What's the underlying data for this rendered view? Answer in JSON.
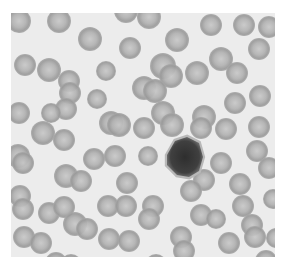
{
  "image": {
    "caption": "Blood smear micrograph with red blood cells and a central lymphocyte",
    "background_color": "#ececec",
    "cell_color": "#9e9e9e",
    "cell_center_color": "#c4c4c4",
    "lymphocyte_color": "#3a3a3a"
  },
  "cells": [
    [
      8,
      8,
      12
    ],
    [
      48,
      8,
      12
    ],
    [
      115,
      -2,
      12
    ],
    [
      138,
      4,
      12
    ],
    [
      200,
      12,
      11
    ],
    [
      233,
      12,
      11
    ],
    [
      258,
      14,
      11
    ],
    [
      79,
      26,
      12
    ],
    [
      119,
      35,
      11
    ],
    [
      166,
      27,
      12
    ],
    [
      210,
      46,
      12
    ],
    [
      248,
      36,
      11
    ],
    [
      14,
      52,
      11
    ],
    [
      38,
      57,
      12
    ],
    [
      58,
      68,
      11
    ],
    [
      95,
      58,
      10
    ],
    [
      152,
      53,
      13
    ],
    [
      160,
      63,
      12
    ],
    [
      186,
      60,
      12
    ],
    [
      226,
      60,
      11
    ],
    [
      59,
      80,
      11
    ],
    [
      55,
      96,
      11
    ],
    [
      40,
      100,
      10
    ],
    [
      86,
      86,
      10
    ],
    [
      133,
      75,
      12
    ],
    [
      144,
      78,
      12
    ],
    [
      249,
      83,
      11
    ],
    [
      224,
      90,
      11
    ],
    [
      8,
      100,
      11
    ],
    [
      32,
      120,
      12
    ],
    [
      100,
      110,
      12
    ],
    [
      108,
      112,
      12
    ],
    [
      152,
      100,
      12
    ],
    [
      161,
      112,
      12
    ],
    [
      193,
      104,
      12
    ],
    [
      190,
      115,
      11
    ],
    [
      215,
      116,
      11
    ],
    [
      248,
      114,
      11
    ],
    [
      53,
      127,
      11
    ],
    [
      133,
      115,
      11
    ],
    [
      246,
      138,
      11
    ],
    [
      7,
      143,
      12
    ],
    [
      12,
      150,
      11
    ],
    [
      83,
      146,
      11
    ],
    [
      104,
      143,
      11
    ],
    [
      137,
      143,
      10
    ],
    [
      210,
      150,
      11
    ],
    [
      258,
      155,
      11
    ],
    [
      193,
      167,
      11
    ],
    [
      55,
      163,
      12
    ],
    [
      70,
      168,
      11
    ],
    [
      116,
      170,
      11
    ],
    [
      180,
      178,
      11
    ],
    [
      229,
      171,
      11
    ],
    [
      9,
      183,
      11
    ],
    [
      12,
      196,
      11
    ],
    [
      38,
      200,
      11
    ],
    [
      53,
      194,
      11
    ],
    [
      97,
      193,
      11
    ],
    [
      115,
      193,
      11
    ],
    [
      142,
      193,
      11
    ],
    [
      138,
      206,
      11
    ],
    [
      232,
      193,
      11
    ],
    [
      262,
      186,
      10
    ],
    [
      190,
      202,
      11
    ],
    [
      205,
      206,
      10
    ],
    [
      265,
      225,
      10
    ],
    [
      13,
      224,
      11
    ],
    [
      30,
      230,
      11
    ],
    [
      64,
      211,
      12
    ],
    [
      76,
      216,
      11
    ],
    [
      98,
      226,
      11
    ],
    [
      118,
      228,
      11
    ],
    [
      170,
      224,
      11
    ],
    [
      173,
      238,
      11
    ],
    [
      218,
      230,
      11
    ],
    [
      241,
      212,
      11
    ],
    [
      244,
      224,
      11
    ],
    [
      45,
      250,
      11
    ],
    [
      60,
      252,
      11
    ],
    [
      103,
      255,
      11
    ],
    [
      145,
      252,
      11
    ],
    [
      174,
      256,
      11
    ],
    [
      220,
      255,
      11
    ],
    [
      255,
      248,
      11
    ]
  ],
  "lymphocyte": {
    "x": 174,
    "y": 144,
    "r": 20
  }
}
